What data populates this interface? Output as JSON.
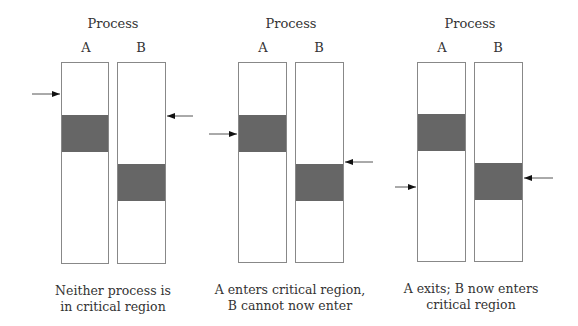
{
  "panels": [
    {
      "title": "Process",
      "labels": [
        "A",
        "B"
      ],
      "caption_line1": "Neither process is",
      "caption_line2": "in critical region",
      "bars": [
        {
          "x": 61,
          "crit_top": 52,
          "crit_h": 37
        },
        {
          "x": 117,
          "crit_top": 101,
          "crit_h": 37
        }
      ],
      "arrows": [
        {
          "side": "left",
          "y": 94,
          "x1": 32,
          "x2": 60
        },
        {
          "side": "right",
          "y": 116,
          "x1": 193,
          "x2": 166
        }
      ]
    },
    {
      "title": "Process",
      "labels": [
        "A",
        "B"
      ],
      "caption_line1": "A enters critical region,",
      "caption_line2": "B cannot now enter",
      "bars": [
        {
          "x": 238,
          "crit_top": 52,
          "crit_h": 37
        },
        {
          "x": 295,
          "crit_top": 101,
          "crit_h": 37
        }
      ],
      "arrows": [
        {
          "side": "left",
          "y": 134,
          "x1": 209,
          "x2": 237
        },
        {
          "side": "right",
          "y": 162,
          "x1": 373,
          "x2": 344
        }
      ]
    },
    {
      "title": "Process",
      "labels": [
        "A",
        "B"
      ],
      "caption_line1": "A exits; B now enters",
      "caption_line2": "critical region",
      "bars": [
        {
          "x": 417,
          "crit_top": 51,
          "crit_h": 37
        },
        {
          "x": 474,
          "crit_top": 100,
          "crit_h": 37
        }
      ],
      "arrows": [
        {
          "side": "left",
          "y": 187,
          "x1": 395,
          "x2": 416
        },
        {
          "side": "right",
          "y": 178,
          "x1": 553,
          "x2": 524
        }
      ]
    }
  ],
  "colors": {
    "critical_region": "#666666",
    "border": "#888888"
  }
}
